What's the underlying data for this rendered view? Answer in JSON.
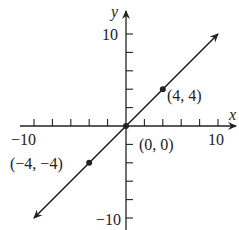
{
  "chart_data": {
    "type": "line",
    "title": "",
    "xlabel": "x",
    "ylabel": "y",
    "xlim": [
      -10,
      10
    ],
    "ylim": [
      -10,
      10
    ],
    "grid": false,
    "tick_step": 2,
    "x_tick_labels": [
      "-10",
      "10"
    ],
    "y_tick_labels": [
      "10",
      "-10"
    ],
    "series": [
      {
        "name": "y = x",
        "x": [
          -10,
          10
        ],
        "y": [
          -10,
          10
        ],
        "arrows_both_ends": true
      }
    ],
    "points": [
      {
        "x": -4,
        "y": -4,
        "label": "(−4, −4)"
      },
      {
        "x": 0,
        "y": 0,
        "label": "(0, 0)"
      },
      {
        "x": 4,
        "y": 4,
        "label": "(4, 4)"
      }
    ],
    "colors": {
      "ink": "#222222",
      "background": "#ffffff"
    }
  },
  "labels": {
    "x_axis": "x",
    "y_axis": "y",
    "x_min": "−10",
    "x_max": "10",
    "y_max": "10",
    "y_min": "−10",
    "p_neg": "(−4, −4)",
    "p_origin": "(0, 0)",
    "p_pos": "(4, 4)"
  }
}
